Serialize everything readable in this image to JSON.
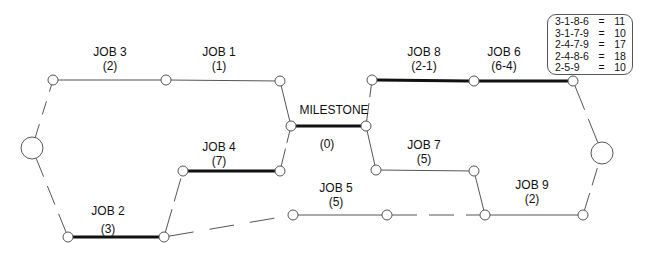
{
  "jobs": [
    {
      "id": "job3",
      "name": "JOB 3",
      "duration": "(2)",
      "critical": false
    },
    {
      "id": "job1",
      "name": "JOB 1",
      "duration": "(1)",
      "critical": false
    },
    {
      "id": "milestone",
      "name": "MILESTONE",
      "duration": "(0)",
      "critical": true
    },
    {
      "id": "job8",
      "name": "JOB 8",
      "duration": "(2-1)",
      "critical": true
    },
    {
      "id": "job6",
      "name": "JOB 6",
      "duration": "(6-4)",
      "critical": true
    },
    {
      "id": "job2",
      "name": "JOB 2",
      "duration": "(3)",
      "critical": true
    },
    {
      "id": "job4",
      "name": "JOB 4",
      "duration": "(7)",
      "critical": true
    },
    {
      "id": "job5",
      "name": "JOB 5",
      "duration": "(5)",
      "critical": false
    },
    {
      "id": "job7",
      "name": "JOB 7",
      "duration": "(5)",
      "critical": false
    },
    {
      "id": "job9",
      "name": "JOB 9",
      "duration": "(2)",
      "critical": false
    }
  ],
  "legend": {
    "rows": [
      {
        "path": "3-1-8-6",
        "eq": "=",
        "value": "11"
      },
      {
        "path": "3-1-7-9",
        "eq": "=",
        "value": "10"
      },
      {
        "path": "2-4-7-9",
        "eq": "=",
        "value": "17"
      },
      {
        "path": "2-4-8-6",
        "eq": "=",
        "value": "18"
      },
      {
        "path": "2-5-9",
        "eq": "=",
        "value": "10"
      }
    ]
  },
  "colors": {
    "line": "#555555",
    "critical": "#111111",
    "background": "#ffffff"
  }
}
